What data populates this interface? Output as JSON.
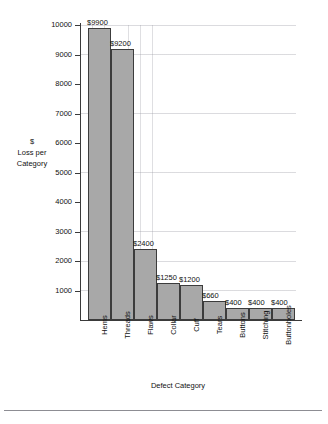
{
  "chart_data": {
    "type": "bar",
    "title": "",
    "xlabel": "Defect Category",
    "ylabel": "$ Loss per Category",
    "ylabel_lines": [
      "$",
      "Loss per",
      "Category"
    ],
    "categories": [
      "Hems",
      "Threads",
      "Flaws",
      "Collar",
      "Cuff",
      "Tears",
      "Buttons",
      "Stitching",
      "Buttonholes"
    ],
    "values": [
      9900,
      9200,
      2400,
      1250,
      1200,
      660,
      400,
      400,
      400
    ],
    "value_labels": [
      "$9900",
      "$9200",
      "$2400",
      "$1250",
      "$1200",
      "$660",
      "$400",
      "$400",
      "$400"
    ],
    "ylim": [
      0,
      10000
    ],
    "ytick_values": [
      1000,
      2000,
      3000,
      4000,
      5000,
      6000,
      7000,
      8000,
      9000,
      10000
    ],
    "ytick_labels": [
      "1000",
      "2000",
      "3000",
      "4000",
      "5000",
      "6000",
      "7000",
      "8000",
      "9000",
      "10000"
    ],
    "grid": true,
    "legend": "none",
    "bar_color": "#a8a8a8",
    "bar_edge_color": "#3c3c3c",
    "grid_color": "#c8c8d0",
    "axis_color": "#3a3a3a"
  }
}
